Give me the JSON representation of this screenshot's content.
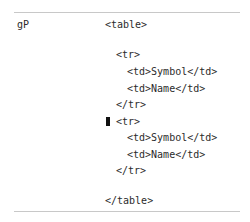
{
  "row_label": "gP",
  "code_lines": [
    {
      "text": "<table>",
      "left": 105,
      "top": 19
    },
    {
      "text": "<tr>",
      "left": 116,
      "top": 49
    },
    {
      "text": "<td>Symbol</td>",
      "left": 127,
      "top": 66
    },
    {
      "text": "<td>Name</td>",
      "left": 127,
      "top": 83
    },
    {
      "text": "</tr>",
      "left": 116,
      "top": 99
    },
    {
      "text": "<tr>",
      "left": 116,
      "top": 116
    },
    {
      "text": "<td>Symbol</td>",
      "left": 127,
      "top": 132
    },
    {
      "text": "<td>Name</td>",
      "left": 127,
      "top": 149
    },
    {
      "text": "</tr>",
      "left": 116,
      "top": 165
    },
    {
      "text": "</table>",
      "left": 105,
      "top": 195
    }
  ],
  "cursor": {
    "line_index": 5
  }
}
